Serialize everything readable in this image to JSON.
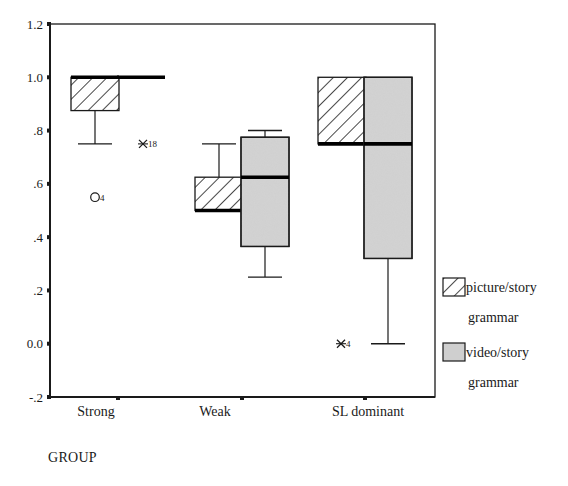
{
  "chart_data": {
    "type": "box",
    "title": "",
    "xlabel": "GROUP",
    "ylabel": "",
    "ylim": [
      -0.2,
      1.2
    ],
    "y_ticks": [
      {
        "value": 1.2,
        "label": "1.2"
      },
      {
        "value": 1.0,
        "label": "1.0"
      },
      {
        "value": 0.8,
        "label": ".8"
      },
      {
        "value": 0.6,
        "label": ".6"
      },
      {
        "value": 0.4,
        "label": ".4"
      },
      {
        "value": 0.2,
        "label": ".2"
      },
      {
        "value": 0.0,
        "label": "0.0"
      },
      {
        "value": -0.2,
        "label": "-.2"
      }
    ],
    "categories": [
      "Strong",
      "Weak",
      "SL dominant"
    ],
    "grid": false,
    "legend_position": "right",
    "series": [
      {
        "name": "picture/story grammar",
        "fill": "hatch",
        "boxes": [
          {
            "category": "Strong",
            "whisker_low": 0.75,
            "q1": 0.875,
            "median": 1.0,
            "q3": 1.0,
            "whisker_high": 1.0
          },
          {
            "category": "Weak",
            "whisker_low": 0.5,
            "q1": 0.5,
            "median": 0.5,
            "q3": 0.625,
            "whisker_high": 0.75
          },
          {
            "category": "SL dominant",
            "whisker_low": 0.75,
            "q1": 0.75,
            "median": 0.75,
            "q3": 1.0,
            "whisker_high": 1.0
          }
        ]
      },
      {
        "name": "video/story grammar",
        "fill": "#cfcfcf",
        "boxes": [
          {
            "category": "Strong",
            "whisker_low": 1.0,
            "q1": 1.0,
            "median": 1.0,
            "q3": 1.0,
            "whisker_high": 1.0
          },
          {
            "category": "Weak",
            "whisker_low": 0.25,
            "q1": 0.365,
            "median": 0.625,
            "q3": 0.775,
            "whisker_high": 0.8
          },
          {
            "category": "SL dominant",
            "whisker_low": 0.0,
            "q1": 0.32,
            "median": 0.75,
            "q3": 1.0,
            "whisker_high": 1.0
          }
        ]
      }
    ],
    "outliers": [
      {
        "category": "Strong",
        "series": "picture/story grammar",
        "value": 0.55,
        "marker": "circle",
        "label": "4"
      },
      {
        "category": "Strong",
        "series": "video/story grammar",
        "value": 0.75,
        "marker": "asterisk",
        "label": "18"
      },
      {
        "category": "SL dominant",
        "series": "picture/story grammar",
        "value": 0.0,
        "marker": "asterisk",
        "label": "4"
      }
    ],
    "legend": [
      {
        "label_line1": "picture/story",
        "label_line2": "grammar",
        "fill": "hatch"
      },
      {
        "label_line1": "video/story",
        "label_line2": "grammar",
        "fill": "#cfcfcf"
      }
    ]
  },
  "colors": {
    "axis": "#1a1a1a",
    "video_fill": "#cfcfcf",
    "background": "#ffffff"
  }
}
